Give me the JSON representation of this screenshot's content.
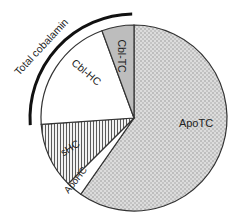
{
  "chart_data": {
    "type": "pie",
    "title": "",
    "start_angle_deg": 0,
    "direction": "clockwise",
    "slices": [
      {
        "label": "ApoTC",
        "value": 59.7,
        "fill": "dots",
        "color": "#d9d9d9"
      },
      {
        "label": "ApoHC",
        "value": 2.8,
        "fill": "solid",
        "color": "#ffffff"
      },
      {
        "label": "sHC",
        "value": 11.4,
        "fill": "vstripe",
        "color": "#e6e6e6"
      },
      {
        "label": "Cbl-HC",
        "value": 20.5,
        "fill": "solid",
        "color": "#ffffff"
      },
      {
        "label": "Cbl-TC",
        "value": 5.6,
        "fill": "solid",
        "color": "#bdbdbd"
      }
    ],
    "annotations": [
      {
        "text": "Total cobalamin",
        "type": "arc-bracket",
        "spans": [
          "Cbl-HC",
          "Cbl-TC"
        ]
      }
    ],
    "legend": "none"
  },
  "labels": {
    "apotc": "ApoTC",
    "apohc": "ApoHC",
    "shc": "sHC",
    "cblhc": "Cbl-HC",
    "cbltc": "Cbl-TC",
    "total": "Total cobalamin"
  }
}
